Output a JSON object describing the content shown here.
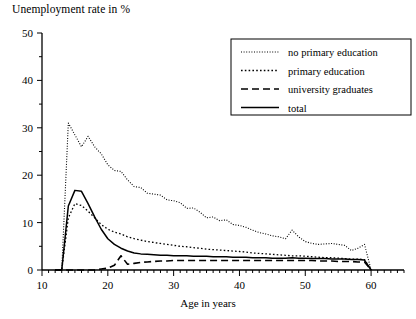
{
  "chart_data": {
    "type": "line",
    "title": "Unemployment rate in %",
    "xlabel": "Age in years",
    "ylabel": "Unemployment rate in %",
    "xlim": [
      10,
      65
    ],
    "ylim": [
      0,
      50
    ],
    "grid": false,
    "legend_position": "top-right",
    "x_ticks": [
      10,
      20,
      30,
      40,
      50,
      60
    ],
    "x_tick_labels": [
      "10",
      "20",
      "30",
      "40",
      "50",
      "60"
    ],
    "x_minor_tick_step": 1,
    "y_ticks": [
      0,
      10,
      20,
      30,
      40,
      50
    ],
    "y_tick_labels": [
      "0",
      "10",
      "20",
      "30",
      "40",
      "50"
    ],
    "y_minor_tick_step": 5,
    "x": [
      12,
      13,
      14,
      15,
      16,
      17,
      18,
      19,
      20,
      21,
      22,
      23,
      24,
      25,
      26,
      27,
      28,
      29,
      30,
      31,
      32,
      33,
      34,
      35,
      36,
      37,
      38,
      39,
      40,
      41,
      42,
      43,
      44,
      45,
      46,
      47,
      48,
      49,
      50,
      51,
      52,
      53,
      54,
      55,
      56,
      57,
      58,
      59,
      60
    ],
    "series": [
      {
        "name": "no primary education",
        "style": "fine-dotted",
        "color": "#000000",
        "values": [
          0,
          0,
          31.0,
          28.5,
          26.0,
          28.2,
          26.0,
          24.5,
          22.2,
          21.0,
          20.8,
          19.0,
          17.6,
          17.4,
          16.2,
          16.0,
          15.8,
          14.8,
          14.6,
          14.2,
          13.0,
          13.1,
          12.2,
          11.0,
          11.2,
          10.4,
          10.6,
          9.6,
          9.4,
          9.0,
          8.4,
          7.9,
          7.6,
          7.2,
          7.0,
          6.6,
          8.4,
          7.0,
          6.0,
          5.6,
          5.4,
          5.5,
          5.6,
          5.4,
          5.2,
          4.1,
          4.6,
          5.4,
          0
        ]
      },
      {
        "name": "primary education",
        "style": "dotted",
        "color": "#000000",
        "values": [
          0,
          0,
          11.0,
          14.0,
          13.6,
          12.4,
          11.0,
          9.6,
          8.6,
          8.0,
          7.6,
          7.0,
          6.6,
          6.3,
          6.0,
          5.8,
          5.6,
          5.4,
          5.2,
          5.0,
          4.9,
          4.7,
          4.6,
          4.4,
          4.3,
          4.2,
          4.1,
          4.0,
          3.9,
          3.8,
          3.6,
          3.5,
          3.4,
          3.3,
          3.2,
          3.1,
          3.0,
          3.0,
          2.9,
          2.8,
          2.7,
          2.6,
          2.6,
          2.5,
          2.4,
          2.3,
          2.3,
          2.2,
          0
        ]
      },
      {
        "name": "university graduates",
        "style": "dashed",
        "color": "#000000",
        "values": [
          0,
          0,
          0,
          0,
          0,
          0,
          0,
          0.2,
          0.4,
          1.0,
          3.0,
          1.2,
          1.4,
          1.6,
          1.7,
          1.8,
          1.9,
          1.9,
          2.0,
          2.0,
          2.0,
          2.0,
          2.0,
          2.0,
          2.0,
          2.0,
          2.0,
          2.0,
          2.0,
          2.0,
          2.0,
          2.0,
          2.0,
          2.0,
          2.0,
          2.0,
          2.0,
          2.0,
          2.0,
          2.0,
          1.9,
          1.9,
          1.9,
          1.8,
          1.8,
          1.8,
          1.7,
          1.7,
          0
        ]
      },
      {
        "name": "total",
        "style": "solid",
        "color": "#000000",
        "values": [
          0,
          0,
          13.5,
          16.8,
          16.6,
          14.0,
          11.2,
          8.6,
          6.6,
          5.4,
          4.6,
          4.0,
          3.6,
          3.4,
          3.3,
          3.2,
          3.1,
          3.1,
          3.0,
          3.0,
          3.0,
          2.9,
          2.9,
          2.9,
          2.8,
          2.8,
          2.8,
          2.7,
          2.7,
          2.7,
          2.6,
          2.6,
          2.6,
          2.5,
          2.5,
          2.5,
          2.6,
          2.5,
          2.5,
          2.4,
          2.4,
          2.4,
          2.3,
          2.3,
          2.3,
          2.2,
          2.2,
          2.1,
          0
        ]
      }
    ]
  },
  "legend": {
    "entries": [
      {
        "label": "no primary education"
      },
      {
        "label": "primary education"
      },
      {
        "label": "university graduates"
      },
      {
        "label": "total"
      }
    ]
  }
}
